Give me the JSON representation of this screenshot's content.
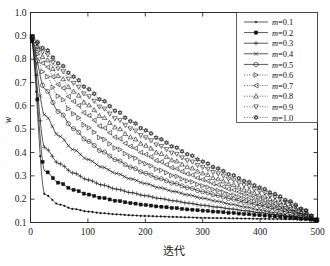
{
  "figure": {
    "background_color": "#ffffff",
    "line_color": "#111111"
  },
  "axes": {
    "x_ticks": [
      "0",
      "100",
      "200",
      "300",
      "400",
      "500"
    ],
    "y_ticks": [
      "0.1",
      "0.2",
      "0.3",
      "0.4",
      "0.5",
      "0.6",
      "0.7",
      "0.8",
      "0.9",
      "1.0"
    ],
    "x_title": "迭代",
    "y_title": "w"
  },
  "legend": {
    "entries": [
      {
        "label_var": "m",
        "label_eq": "=0.1",
        "marker": "dot-marker",
        "style": "solid"
      },
      {
        "label_var": "m",
        "label_eq": "=0.2",
        "marker": "filled-square-marker",
        "style": "solid"
      },
      {
        "label_var": "m",
        "label_eq": "=0.3",
        "marker": "plus-marker",
        "style": "solid"
      },
      {
        "label_var": "m",
        "label_eq": "=0.4",
        "marker": "cross-marker",
        "style": "solid"
      },
      {
        "label_var": "m",
        "label_eq": "=0.5",
        "marker": "circle-marker",
        "style": "solid"
      },
      {
        "label_var": "m",
        "label_eq": "=0.6",
        "marker": "right-triangle-marker",
        "style": "dotted"
      },
      {
        "label_var": "m",
        "label_eq": "=0.7",
        "marker": "left-triangle-marker",
        "style": "dotted"
      },
      {
        "label_var": "m",
        "label_eq": "=0.8",
        "marker": "up-triangle-marker",
        "style": "dotted"
      },
      {
        "label_var": "m",
        "label_eq": "=0.9",
        "marker": "down-triangle-marker",
        "style": "dotted"
      },
      {
        "label_var": "m",
        "label_eq": "=1.0",
        "marker": "hexagram-marker",
        "style": "dotted"
      }
    ]
  },
  "chart_data": {
    "type": "line",
    "title": "",
    "xlabel": "迭代",
    "ylabel": "w",
    "xlim": [
      0,
      500
    ],
    "ylim": [
      0.1,
      1.0
    ],
    "xticks": [
      0,
      100,
      200,
      300,
      400,
      500
    ],
    "yticks": [
      0.1,
      0.2,
      0.3,
      0.4,
      0.5,
      0.6,
      0.7,
      0.8,
      0.9,
      1.0
    ],
    "grid": false,
    "legend_position": "top-right",
    "w_max": 0.9,
    "w_min": 0.11,
    "formula": "w = w_min + (w_max - w_min) * (1 - t/T)^(1/m)",
    "x": [
      0,
      25,
      50,
      75,
      100,
      125,
      150,
      175,
      200,
      225,
      250,
      275,
      300,
      325,
      350,
      375,
      400,
      425,
      450,
      475,
      500
    ],
    "series": [
      {
        "name": "m=0.1",
        "marker": "dot-marker",
        "style": "solid",
        "values": [
          0.9,
          0.22,
          0.177,
          0.158,
          0.147,
          0.14,
          0.135,
          0.131,
          0.128,
          0.126,
          0.124,
          0.122,
          0.12,
          0.119,
          0.118,
          0.117,
          0.116,
          0.115,
          0.114,
          0.112,
          0.11
        ]
      },
      {
        "name": "m=0.2",
        "marker": "filled-square-marker",
        "style": "solid",
        "values": [
          0.9,
          0.32,
          0.27,
          0.24,
          0.22,
          0.205,
          0.193,
          0.183,
          0.175,
          0.168,
          0.162,
          0.156,
          0.151,
          0.146,
          0.141,
          0.136,
          0.131,
          0.126,
          0.121,
          0.116,
          0.11
        ]
      },
      {
        "name": "m=0.3",
        "marker": "plus-marker",
        "style": "solid",
        "values": [
          0.9,
          0.42,
          0.352,
          0.312,
          0.283,
          0.261,
          0.243,
          0.228,
          0.215,
          0.203,
          0.193,
          0.183,
          0.174,
          0.166,
          0.158,
          0.15,
          0.142,
          0.134,
          0.126,
          0.118,
          0.11
        ]
      },
      {
        "name": "m=0.4",
        "marker": "cross-marker",
        "style": "solid",
        "values": [
          0.9,
          0.56,
          0.47,
          0.412,
          0.37,
          0.337,
          0.31,
          0.287,
          0.267,
          0.249,
          0.233,
          0.218,
          0.204,
          0.191,
          0.178,
          0.166,
          0.154,
          0.142,
          0.131,
          0.12,
          0.11
        ]
      },
      {
        "name": "m=0.5",
        "marker": "circle-marker",
        "style": "solid",
        "values": [
          0.9,
          0.672,
          0.574,
          0.502,
          0.448,
          0.404,
          0.368,
          0.337,
          0.311,
          0.288,
          0.268,
          0.249,
          0.232,
          0.216,
          0.201,
          0.186,
          0.172,
          0.158,
          0.144,
          0.128,
          0.11
        ]
      },
      {
        "name": "m=0.6",
        "marker": "right-triangle-marker",
        "style": "dotted",
        "values": [
          0.9,
          0.735,
          0.64,
          0.566,
          0.507,
          0.459,
          0.418,
          0.383,
          0.352,
          0.325,
          0.3,
          0.278,
          0.257,
          0.238,
          0.219,
          0.202,
          0.185,
          0.168,
          0.151,
          0.132,
          0.11
        ]
      },
      {
        "name": "m=0.7",
        "marker": "left-triangle-marker",
        "style": "dotted",
        "values": [
          0.9,
          0.775,
          0.69,
          0.619,
          0.559,
          0.508,
          0.464,
          0.426,
          0.392,
          0.361,
          0.333,
          0.308,
          0.284,
          0.262,
          0.241,
          0.221,
          0.201,
          0.181,
          0.161,
          0.138,
          0.11
        ]
      },
      {
        "name": "m=0.8",
        "marker": "up-triangle-marker",
        "style": "dotted",
        "values": [
          0.9,
          0.804,
          0.728,
          0.662,
          0.604,
          0.552,
          0.507,
          0.466,
          0.43,
          0.396,
          0.366,
          0.338,
          0.312,
          0.287,
          0.263,
          0.241,
          0.218,
          0.196,
          0.172,
          0.145,
          0.11
        ]
      },
      {
        "name": "m=0.9",
        "marker": "down-triangle-marker",
        "style": "dotted",
        "values": [
          0.9,
          0.826,
          0.758,
          0.697,
          0.641,
          0.59,
          0.544,
          0.502,
          0.464,
          0.428,
          0.396,
          0.365,
          0.337,
          0.31,
          0.284,
          0.259,
          0.234,
          0.209,
          0.182,
          0.151,
          0.11
        ]
      },
      {
        "name": "m=1.0",
        "marker": "hexagram-marker",
        "style": "dotted",
        "values": [
          0.9,
          0.844,
          0.781,
          0.725,
          0.672,
          0.623,
          0.577,
          0.534,
          0.495,
          0.458,
          0.424,
          0.392,
          0.361,
          0.332,
          0.304,
          0.277,
          0.25,
          0.222,
          0.192,
          0.157,
          0.11
        ]
      }
    ]
  }
}
